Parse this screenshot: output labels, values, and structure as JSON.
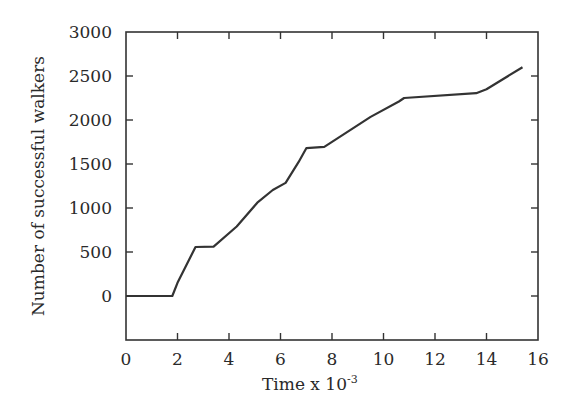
{
  "chart_data": {
    "type": "line",
    "title": "",
    "xlabel": "Time x 10",
    "xlabel_exponent": "-3",
    "ylabel": "Number of successful walkers",
    "xlim": [
      0,
      16
    ],
    "ylim": [
      -500,
      3000
    ],
    "x_ticks": [
      0,
      2,
      4,
      6,
      8,
      10,
      12,
      14,
      16
    ],
    "y_ticks": [
      0,
      500,
      1000,
      1500,
      2000,
      2500,
      3000
    ],
    "grid": false,
    "legend": null,
    "series": [
      {
        "name": "successful walkers",
        "color": "#333333",
        "x": [
          0,
          1.8,
          2.0,
          2.7,
          3.4,
          4.3,
          5.1,
          5.7,
          6.2,
          6.7,
          7.0,
          7.7,
          9.5,
          10.6,
          10.8,
          13.6,
          14.0,
          15.4
        ],
        "y": [
          0,
          0,
          150,
          557,
          560,
          790,
          1060,
          1205,
          1285,
          1520,
          1680,
          1695,
          2035,
          2210,
          2250,
          2305,
          2350,
          2600
        ]
      }
    ]
  },
  "labels": {
    "xlabel_main": "Time x 10",
    "xlabel_sup": "-3",
    "ylabel": "Number of successful walkers"
  }
}
